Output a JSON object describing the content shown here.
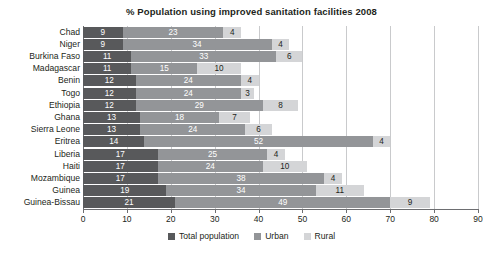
{
  "chart_data": {
    "type": "bar",
    "orientation": "horizontal",
    "stacked": true,
    "title": "% Population using improved sanitation facilities 2008",
    "xlabel": "",
    "ylabel": "",
    "xlim": [
      0,
      90
    ],
    "xticks": [
      0,
      10,
      20,
      30,
      40,
      50,
      60,
      70,
      80,
      90
    ],
    "grid": true,
    "legend_position": "bottom",
    "categories": [
      "Chad",
      "Niger",
      "Burkina Faso",
      "Madagascar",
      "Benin",
      "Togo",
      "Ethiopia",
      "Ghana",
      "Sierra Leone",
      "Eritrea",
      "Liberia",
      "Haiti",
      "Mozambique",
      "Guinea",
      "Guinea-Bissau"
    ],
    "series": [
      {
        "name": "Total population",
        "color": "#58595b",
        "values": [
          9,
          9,
          11,
          11,
          12,
          12,
          12,
          13,
          13,
          14,
          17,
          17,
          17,
          19,
          21
        ]
      },
      {
        "name": "Urban",
        "color": "#939598",
        "values": [
          23,
          34,
          33,
          15,
          24,
          24,
          29,
          18,
          24,
          52,
          25,
          24,
          38,
          34,
          49
        ]
      },
      {
        "name": "Rural",
        "color": "#d4d5d7",
        "values": [
          4,
          4,
          6,
          10,
          4,
          3,
          8,
          7,
          6,
          4,
          4,
          10,
          4,
          11,
          9
        ]
      }
    ]
  },
  "legend": {
    "items": [
      {
        "label": "Total population",
        "swatch": "sw-total"
      },
      {
        "label": "Urban",
        "swatch": "sw-urban"
      },
      {
        "label": "Rural",
        "swatch": "sw-rural"
      }
    ]
  }
}
